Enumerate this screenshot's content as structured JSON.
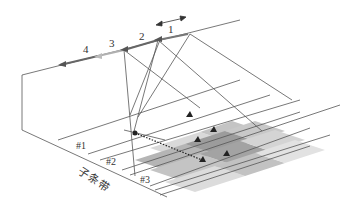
{
  "diagram": {
    "type": "subband-scanning-geometry",
    "positions": [
      {
        "id": "1",
        "label": "1",
        "color": "#6a6a6a"
      },
      {
        "id": "2",
        "label": "2",
        "color": "#6a6a6a"
      },
      {
        "id": "3",
        "label": "3",
        "color": "#b0b0b0"
      },
      {
        "id": "4",
        "label": "4",
        "color": "#6a6a6a"
      }
    ],
    "subbands": [
      {
        "label": "#1"
      },
      {
        "label": "#2"
      },
      {
        "label": "#3"
      }
    ],
    "axis_label": "子条带",
    "motion_arrow": "double-headed",
    "colors": {
      "line": "#555555",
      "light_cell": "#d9d9d9",
      "mid_cell": "#b5b5b5",
      "dark_cell": "#8f8f8f",
      "marker": "#222222"
    }
  }
}
